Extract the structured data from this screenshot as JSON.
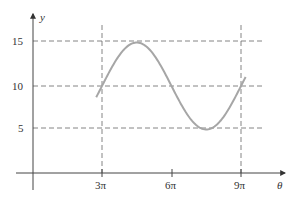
{
  "chart_data": {
    "type": "line",
    "title": "",
    "xlabel": "θ",
    "ylabel": "y",
    "x_ticks": [
      {
        "value": 3,
        "label": "3π"
      },
      {
        "value": 6,
        "label": "6π"
      },
      {
        "value": 9,
        "label": "9π"
      }
    ],
    "y_ticks": [
      {
        "value": 5,
        "label": "5"
      },
      {
        "value": 10,
        "label": "10"
      },
      {
        "value": 15,
        "label": "15"
      }
    ],
    "x_units": "π",
    "xlim": [
      0,
      10.2
    ],
    "ylim": [
      0,
      17
    ],
    "grid": {
      "horizontal_dashed_at": [
        5,
        10,
        15
      ],
      "vertical_dashed_at": [
        3,
        9
      ]
    },
    "series": [
      {
        "name": "y = 10 + 5 sin((θ − 3π)/3)",
        "color": "#a6a6a6",
        "x": [
          2.75,
          3.0,
          3.75,
          4.5,
          5.25,
          6.0,
          6.75,
          7.5,
          8.25,
          9.0,
          9.2
        ],
        "values": [
          8.6,
          10.0,
          13.5,
          15.0,
          13.5,
          10.0,
          6.5,
          5.0,
          6.5,
          10.0,
          11.1
        ]
      }
    ],
    "legend": null
  },
  "colors": {
    "axis": "#444444",
    "grid": "#555555",
    "curve": "#a6a6a6"
  }
}
